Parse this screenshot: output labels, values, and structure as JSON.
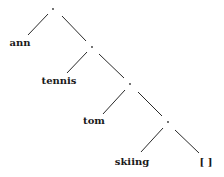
{
  "diagram": {
    "type": "binary-tree",
    "internal_nodes": [
      {
        "id": "n1",
        "label": ".",
        "x": 53,
        "y": 9
      },
      {
        "id": "n2",
        "label": ".",
        "x": 92,
        "y": 47
      },
      {
        "id": "n3",
        "label": ".",
        "x": 130,
        "y": 84
      },
      {
        "id": "n4",
        "label": ".",
        "x": 168,
        "y": 122
      }
    ],
    "leaves": [
      {
        "id": "l1",
        "label": "ann",
        "x": 20,
        "y": 43
      },
      {
        "id": "l2",
        "label": "tennis",
        "x": 59,
        "y": 81
      },
      {
        "id": "l3",
        "label": "tom",
        "x": 94,
        "y": 121
      },
      {
        "id": "l4",
        "label": "skiing",
        "x": 132,
        "y": 162
      },
      {
        "id": "l5",
        "label": "[ ]",
        "x": 206,
        "y": 162
      }
    ],
    "edges": [
      {
        "from": "n1",
        "to": "l1",
        "x1": 48,
        "y1": 14,
        "x2": 28,
        "y2": 35
      },
      {
        "from": "n1",
        "to": "n2",
        "x1": 62,
        "y1": 16,
        "x2": 86,
        "y2": 41
      },
      {
        "from": "n2",
        "to": "l2",
        "x1": 87,
        "y1": 52,
        "x2": 67,
        "y2": 73
      },
      {
        "from": "n2",
        "to": "n3",
        "x1": 99,
        "y1": 54,
        "x2": 124,
        "y2": 78
      },
      {
        "from": "n3",
        "to": "l3",
        "x1": 125,
        "y1": 90,
        "x2": 103,
        "y2": 114
      },
      {
        "from": "n3",
        "to": "n4",
        "x1": 138,
        "y1": 92,
        "x2": 162,
        "y2": 116
      },
      {
        "from": "n4",
        "to": "l4",
        "x1": 163,
        "y1": 128,
        "x2": 141,
        "y2": 152
      },
      {
        "from": "n4",
        "to": "l5",
        "x1": 175,
        "y1": 130,
        "x2": 199,
        "y2": 153
      }
    ]
  }
}
